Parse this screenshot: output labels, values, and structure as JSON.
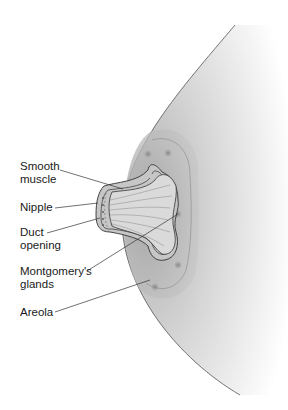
{
  "diagram": {
    "labels": [
      {
        "id": "smooth-muscle",
        "text": "Smooth\nmuscle",
        "x": 20,
        "y": 165
      },
      {
        "id": "nipple",
        "text": "Nipple",
        "x": 20,
        "y": 203
      },
      {
        "id": "duct-opening",
        "text": "Duct\nopening",
        "x": 20,
        "y": 229
      },
      {
        "id": "montgomerys-glands",
        "text": "Montgomery's\nglands",
        "x": 20,
        "y": 266
      },
      {
        "id": "areola",
        "text": "Areola",
        "x": 20,
        "y": 306
      }
    ],
    "colors": {
      "outline": "#3a3a3a",
      "breast_fill_dark": "#bdbdbd",
      "breast_fill_light": "#ffffff",
      "areola_fill": "#b5b5b5",
      "nipple_fill": "#c8c8c8",
      "interior_fill": "#dcdcdc",
      "label_text": "#1a1a1a"
    }
  }
}
